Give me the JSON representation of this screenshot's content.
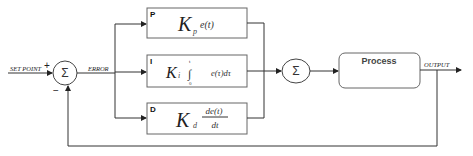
{
  "diagram": {
    "input_label": "SET POINT",
    "error_label": "ERROR",
    "output_label": "OUTPUT",
    "plus_sign": "+",
    "minus_sign": "−",
    "sum_symbol": "Σ",
    "blocks": {
      "p": {
        "corner": "P",
        "K": "K",
        "sub": "p",
        "expr": "e(t)"
      },
      "i": {
        "corner": "I",
        "K": "K",
        "sub": "i",
        "integral": "∫",
        "upper": "t",
        "lower": "0",
        "expr": "e(τ)dτ"
      },
      "d": {
        "corner": "D",
        "K": "K",
        "sub": "d",
        "numerator": "de(t)",
        "denominator": "dt"
      }
    },
    "process_label": "Process",
    "colors": {
      "line": "#333333",
      "box_border": "#555555",
      "background": "#ffffff"
    }
  }
}
